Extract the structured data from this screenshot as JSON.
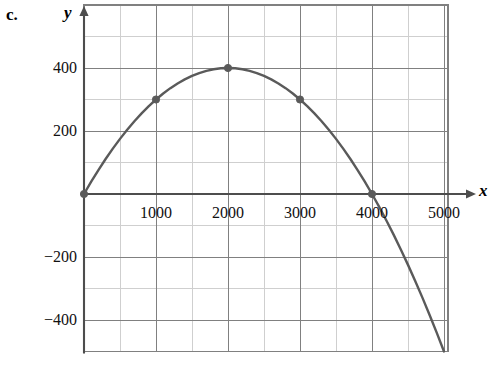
{
  "figure": {
    "part_label": "c.",
    "x_axis_name": "x",
    "y_axis_name": "y"
  },
  "chart_data": {
    "type": "line",
    "title": "",
    "subtitle": "",
    "xlabel": "x",
    "ylabel": "y",
    "xlim": [
      -70,
      5050
    ],
    "ylim": [
      -500,
      600
    ],
    "xticks": [
      1000,
      2000,
      3000,
      4000,
      5000
    ],
    "xtick_labels": [
      "1000",
      "2000",
      "3000",
      "4000",
      "5000"
    ],
    "yticks": [
      -400,
      -200,
      200,
      400
    ],
    "ytick_labels": [
      "-400",
      "-200",
      "200",
      "400"
    ],
    "x_major_step": 1000,
    "x_minor_step": 500,
    "y_major_step": 200,
    "y_minor_step": 100,
    "grid": true,
    "legend": false,
    "curve_color": "#5a5a5a",
    "grid_major_color": "#808080",
    "grid_minor_color": "#cfcfcf",
    "axis_color": "#4d4d4d",
    "equation": "y = -0.0001*x*(x - 4000)",
    "vertex": [
      2000,
      400
    ],
    "roots": [
      0,
      4000
    ],
    "series": [
      {
        "name": "parabola",
        "x": [
          0,
          100,
          200,
          300,
          400,
          500,
          600,
          700,
          800,
          900,
          1000,
          1100,
          1200,
          1300,
          1400,
          1500,
          1600,
          1700,
          1800,
          1900,
          2000,
          2100,
          2200,
          2300,
          2400,
          2500,
          2600,
          2700,
          2800,
          2900,
          3000,
          3100,
          3200,
          3300,
          3400,
          3500,
          3600,
          3700,
          3800,
          3900,
          4000,
          4100,
          4200,
          4300,
          4400,
          4500,
          4600,
          4700,
          4800,
          4900,
          5000,
          5040
        ],
        "y": [
          0,
          39,
          76,
          111,
          144,
          175,
          204,
          231,
          256,
          279,
          300,
          319,
          336,
          351,
          364,
          375,
          384,
          391,
          396,
          399,
          400,
          399,
          396,
          391,
          384,
          375,
          364,
          351,
          336,
          319,
          300,
          279,
          256,
          231,
          204,
          175,
          144,
          111,
          76,
          39,
          0,
          -41,
          -84,
          -129,
          -176,
          -225,
          -276,
          -329,
          -384,
          -441,
          -500,
          -524
        ]
      }
    ],
    "markers": [
      {
        "x": 0,
        "y": 0
      },
      {
        "x": 1000,
        "y": 300
      },
      {
        "x": 2000,
        "y": 400
      },
      {
        "x": 3000,
        "y": 300
      },
      {
        "x": 4000,
        "y": 0
      }
    ],
    "x_tick_label_positions": [
      {
        "value": 1000,
        "label": "1000"
      },
      {
        "value": 2000,
        "label": "2000"
      },
      {
        "value": 3000,
        "label": "3000"
      },
      {
        "value": 4000,
        "label": "4000"
      },
      {
        "value": 5000,
        "label": "5000"
      }
    ],
    "y_tick_label_positions": [
      {
        "value": 400,
        "label": "400"
      },
      {
        "value": 200,
        "label": "200"
      },
      {
        "value": -200,
        "label": "-200"
      },
      {
        "value": -400,
        "label": "-400"
      }
    ]
  }
}
